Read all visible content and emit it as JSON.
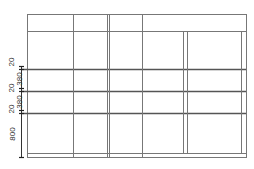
{
  "drawing": {
    "type": "elevation-grid",
    "line_color": "#777777",
    "thick_line_color": "#555555",
    "frame": {
      "x1": 27,
      "y1": 14,
      "x2": 246,
      "y2": 157
    },
    "horizontal_lines": [
      {
        "y": 31,
        "x1": 27,
        "x2": 246,
        "weight": "thin"
      },
      {
        "y": 69,
        "x1": 22,
        "x2": 246,
        "weight": "thick"
      },
      {
        "y": 91,
        "x1": 22,
        "x2": 246,
        "weight": "thick"
      },
      {
        "y": 113,
        "x1": 22,
        "x2": 246,
        "weight": "thick"
      },
      {
        "y": 153,
        "x1": 27,
        "x2": 246,
        "weight": "thin"
      }
    ],
    "vertical_lines": [
      {
        "x": 73,
        "y1": 14,
        "y2": 157,
        "weight": "thin"
      },
      {
        "x": 107,
        "y1": 14,
        "y2": 157,
        "weight": "thin"
      },
      {
        "x": 109,
        "y1": 14,
        "y2": 157,
        "weight": "thin"
      },
      {
        "x": 142,
        "y1": 14,
        "y2": 157,
        "weight": "thin"
      },
      {
        "x": 183,
        "y1": 31,
        "y2": 153,
        "weight": "thin"
      },
      {
        "x": 187,
        "y1": 31,
        "y2": 153,
        "weight": "thin"
      },
      {
        "x": 241,
        "y1": 31,
        "y2": 153,
        "weight": "thin"
      }
    ],
    "dimension_line": {
      "x": 21,
      "y1": 66,
      "y2": 157,
      "ticks": [
        66,
        69,
        88,
        91,
        110,
        113,
        157
      ]
    },
    "dimension_labels": [
      {
        "text": "20",
        "x": 12,
        "y": 62
      },
      {
        "text": "380",
        "x": 19,
        "y": 79
      },
      {
        "text": "20",
        "x": 12,
        "y": 88
      },
      {
        "text": "380",
        "x": 19,
        "y": 102
      },
      {
        "text": "20",
        "x": 12,
        "y": 109
      },
      {
        "text": "800",
        "x": 12,
        "y": 134
      }
    ]
  }
}
